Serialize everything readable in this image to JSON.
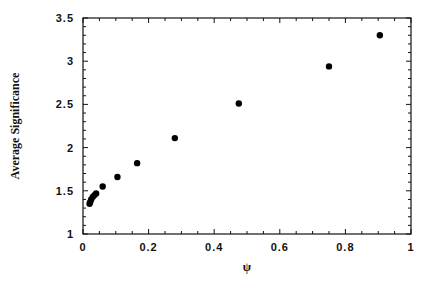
{
  "chart_data": {
    "type": "scatter",
    "title": "",
    "xlabel": "ψ",
    "ylabel": "Average Significance",
    "xlim": [
      0,
      1
    ],
    "ylim": [
      1,
      3.5
    ],
    "grid": false,
    "legend": null,
    "x_ticks": [
      "0",
      "0.2",
      "0.4",
      "0.6",
      "0.8",
      "1"
    ],
    "y_ticks": [
      "1",
      "1.5",
      "2",
      "2.5",
      "3",
      "3.5"
    ],
    "series": [
      {
        "name": "data",
        "marker": "filled-circle",
        "color": "#000000",
        "x": [
          0.02,
          0.022,
          0.025,
          0.03,
          0.035,
          0.04,
          0.06,
          0.105,
          0.165,
          0.28,
          0.475,
          0.75,
          0.905
        ],
        "y": [
          1.35,
          1.37,
          1.4,
          1.43,
          1.45,
          1.47,
          1.55,
          1.66,
          1.82,
          2.11,
          2.51,
          2.94,
          3.3
        ]
      }
    ]
  }
}
